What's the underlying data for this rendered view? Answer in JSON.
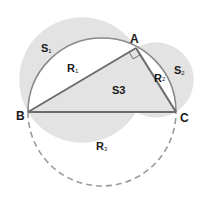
{
  "diagram": {
    "points": {
      "A": {
        "label": "A",
        "x": 136,
        "y": 48
      },
      "B": {
        "label": "B",
        "x": 28,
        "y": 112
      },
      "C": {
        "label": "C",
        "x": 176,
        "y": 112
      }
    },
    "regions": {
      "S1": {
        "main": "S",
        "sub": "1"
      },
      "S2": {
        "main": "S",
        "sub": "2"
      },
      "S3": {
        "text": "S3"
      },
      "R1": {
        "main": "R",
        "sub": "1"
      },
      "R2": {
        "main": "R",
        "sub": "2"
      },
      "R3": {
        "main": "R",
        "sub": "3"
      }
    },
    "right_angle_at": "A",
    "colors": {
      "shade": "#e3e3e3",
      "line": "#6b6b6b",
      "arc": "#8a8a8a",
      "dashed": "#9a9a9a",
      "text": "#1a1a1a"
    }
  }
}
